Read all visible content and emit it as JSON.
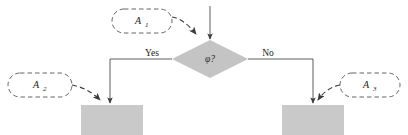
{
  "diagram": {
    "type": "flowchart",
    "background_color": "#ffffff",
    "line_color": "#4a4a4a",
    "dashed_color": "#555555",
    "box_fill": "#c9c9c9",
    "diamond_fill": "#c4c4c4",
    "decision": {
      "label": "φ?",
      "shape": "diamond"
    },
    "branches": {
      "yes_label": "Yes",
      "no_label": "No"
    },
    "annotations": [
      {
        "id": "a1",
        "label": "A",
        "subscript": "1",
        "shape": "dashed-capsule"
      },
      {
        "id": "a2",
        "label": "A",
        "subscript": "2",
        "shape": "dashed-capsule"
      },
      {
        "id": "a3",
        "label": "A",
        "subscript": "3",
        "shape": "dashed-capsule"
      }
    ],
    "process_boxes": [
      {
        "id": "yes-box",
        "label": ""
      },
      {
        "id": "no-box",
        "label": ""
      }
    ]
  }
}
